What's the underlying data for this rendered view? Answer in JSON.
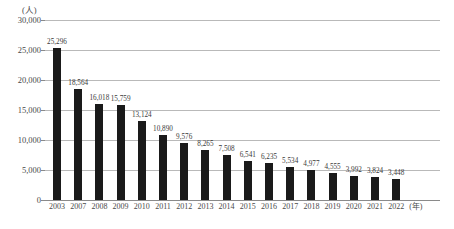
{
  "chart_data": {
    "type": "bar",
    "title": "",
    "subtitle": "",
    "xlabel": "(年)",
    "ylabel": "(人)",
    "ylim": [
      0,
      30000
    ],
    "ytick_labels": [
      "0",
      "5,000",
      "10,000",
      "15,000",
      "20,000",
      "25,000",
      "30,000"
    ],
    "ytick_values": [
      0,
      5000,
      10000,
      15000,
      20000,
      25000,
      30000
    ],
    "grid": true,
    "legend": null,
    "bar_color": "#1a1a1a",
    "categories": [
      "2003",
      "2007",
      "2008",
      "2009",
      "2010",
      "2011",
      "2012",
      "2013",
      "2014",
      "2015",
      "2016",
      "2017",
      "2018",
      "2019",
      "2020",
      "2021",
      "2022"
    ],
    "values": [
      25296,
      18564,
      16018,
      15759,
      13124,
      10890,
      9576,
      8265,
      7508,
      6541,
      6235,
      5534,
      4977,
      4555,
      3992,
      3824,
      3448
    ],
    "value_labels": [
      "25,296",
      "18,564",
      "16,018",
      "15,759",
      "13,124",
      "10,890",
      "9,576",
      "8,265",
      "7,508",
      "6,541",
      "6,235",
      "5,534",
      "4,977",
      "4,555",
      "3,992",
      "3,824",
      "3,448"
    ]
  }
}
